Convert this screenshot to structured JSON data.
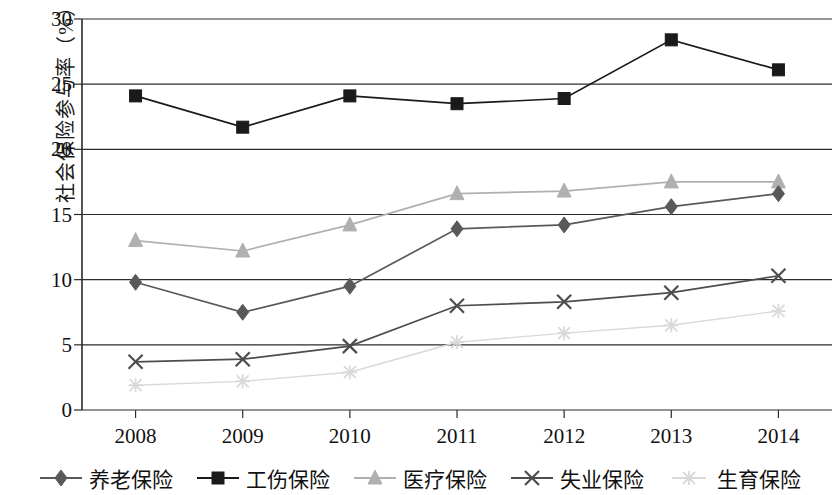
{
  "chart_data": {
    "type": "line",
    "title": "",
    "xlabel": "",
    "ylabel": "社会保险参与率（%）",
    "categories": [
      "2008",
      "2009",
      "2010",
      "2011",
      "2012",
      "2013",
      "2014"
    ],
    "ylim": [
      0,
      30
    ],
    "ytick_labels": [
      "0",
      "5",
      "10",
      "15",
      "20",
      "25",
      "30"
    ],
    "yticks": [
      0,
      5,
      10,
      15,
      20,
      25,
      30
    ],
    "grid": true,
    "grid_axis": "y",
    "legend_position": "bottom",
    "series": [
      {
        "name": "养老保险",
        "marker": "diamond",
        "color": "#595959",
        "values": [
          9.8,
          7.5,
          9.5,
          13.9,
          14.2,
          15.6,
          16.6
        ]
      },
      {
        "name": "工伤保险",
        "marker": "square",
        "color": "#1a1a1a",
        "values": [
          24.1,
          21.7,
          24.1,
          23.5,
          23.9,
          28.4,
          26.1
        ]
      },
      {
        "name": "医疗保险",
        "marker": "triangle",
        "color": "#b0b0b0",
        "values": [
          13.0,
          12.2,
          14.2,
          16.6,
          16.8,
          17.5,
          17.5
        ]
      },
      {
        "name": "失业保险",
        "marker": "x",
        "color": "#4d4d4d",
        "values": [
          3.7,
          3.9,
          4.9,
          8.0,
          8.3,
          9.0,
          10.3
        ]
      },
      {
        "name": "生育保险",
        "marker": "star",
        "color": "#d9d9d9",
        "values": [
          1.9,
          2.2,
          2.9,
          5.2,
          5.9,
          6.5,
          7.6
        ]
      }
    ]
  },
  "axis": {
    "y_label_text": "社会保险参与率（%）"
  },
  "legend": {
    "items": [
      {
        "label": "养老保险"
      },
      {
        "label": "工伤保险"
      },
      {
        "label": "医疗保险"
      },
      {
        "label": "失业保险"
      },
      {
        "label": "生育保险"
      }
    ]
  }
}
